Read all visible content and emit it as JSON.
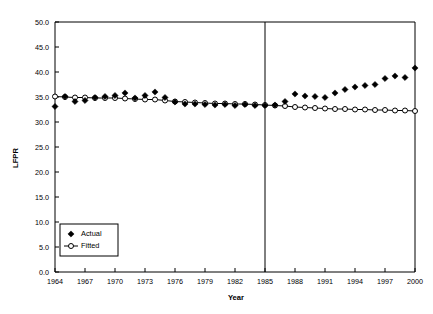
{
  "chart_data": {
    "type": "scatter",
    "title": "",
    "xlabel": "Year",
    "ylabel": "LFPR",
    "xlim": [
      1964,
      2000
    ],
    "ylim": [
      0.0,
      50.0
    ],
    "grid": false,
    "legend_position": "lower-left",
    "y_ticks": [
      "0.0",
      "5.0",
      "10.0",
      "15.0",
      "20.0",
      "25.0",
      "30.0",
      "35.0",
      "40.0",
      "45.0",
      "50.0"
    ],
    "y_tick_values": [
      0,
      5,
      10,
      15,
      20,
      25,
      30,
      35,
      40,
      45,
      50
    ],
    "x_ticks": [
      "1964",
      "1967",
      "1970",
      "1973",
      "1976",
      "1979",
      "1982",
      "1985",
      "1988",
      "1991",
      "1994",
      "1997",
      "2000"
    ],
    "x_tick_values": [
      1964,
      1967,
      1970,
      1973,
      1976,
      1979,
      1982,
      1985,
      1988,
      1991,
      1994,
      1997,
      2000
    ],
    "annotations": [
      {
        "type": "vertical-line",
        "x": 1985,
        "label": ""
      }
    ],
    "x": [
      1964,
      1965,
      1966,
      1967,
      1968,
      1969,
      1970,
      1971,
      1972,
      1973,
      1974,
      1975,
      1976,
      1977,
      1978,
      1979,
      1980,
      1981,
      1982,
      1983,
      1984,
      1985,
      1986,
      1987,
      1988,
      1989,
      1990,
      1991,
      1992,
      1993,
      1994,
      1995,
      1996,
      1997,
      1998,
      1999,
      2000
    ],
    "series": [
      {
        "name": "Actual",
        "marker": "filled-diamond",
        "line": false,
        "color": "#000000",
        "values": [
          33.1,
          35.1,
          34.1,
          34.3,
          34.9,
          35.1,
          35.3,
          35.8,
          34.8,
          35.3,
          36.0,
          34.9,
          34.0,
          33.6,
          33.6,
          33.5,
          33.4,
          33.5,
          33.3,
          33.5,
          33.3,
          33.3,
          33.4,
          34.1,
          35.6,
          35.2,
          35.1,
          34.9,
          35.8,
          36.5,
          37.0,
          37.3,
          37.5,
          38.7,
          39.2,
          38.9,
          40.8
        ]
      },
      {
        "name": "Fitted",
        "marker": "open-circle",
        "line": true,
        "color": "#000000",
        "values": [
          35.1,
          35.0,
          34.9,
          34.9,
          34.8,
          34.8,
          34.8,
          34.7,
          34.6,
          34.5,
          34.5,
          34.3,
          34.1,
          34.0,
          33.9,
          33.8,
          33.7,
          33.7,
          33.6,
          33.6,
          33.5,
          33.4,
          33.3,
          33.2,
          33.0,
          32.9,
          32.8,
          32.7,
          32.6,
          32.6,
          32.5,
          32.5,
          32.4,
          32.4,
          32.3,
          32.3,
          32.2
        ]
      }
    ]
  },
  "legend": {
    "entries": [
      {
        "label": "Actual"
      },
      {
        "label": "Fitted"
      }
    ]
  }
}
